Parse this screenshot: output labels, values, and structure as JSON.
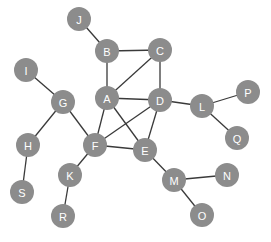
{
  "diagram": {
    "type": "undirected-graph",
    "node_radius": 12,
    "colors": {
      "node_fill": "#8c8c8c",
      "node_label": "#ffffff",
      "edge": "#3a3a3a",
      "background": "#ffffff"
    },
    "nodes": [
      {
        "id": "A",
        "label": "A",
        "x": 107,
        "y": 98
      },
      {
        "id": "B",
        "label": "B",
        "x": 107,
        "y": 51
      },
      {
        "id": "C",
        "label": "C",
        "x": 160,
        "y": 50
      },
      {
        "id": "D",
        "label": "D",
        "x": 160,
        "y": 100
      },
      {
        "id": "E",
        "label": "E",
        "x": 145,
        "y": 150
      },
      {
        "id": "F",
        "label": "F",
        "x": 95,
        "y": 145
      },
      {
        "id": "G",
        "label": "G",
        "x": 63,
        "y": 102
      },
      {
        "id": "H",
        "label": "H",
        "x": 28,
        "y": 145
      },
      {
        "id": "I",
        "label": "I",
        "x": 26,
        "y": 70
      },
      {
        "id": "J",
        "label": "J",
        "x": 79,
        "y": 19
      },
      {
        "id": "K",
        "label": "K",
        "x": 70,
        "y": 175
      },
      {
        "id": "L",
        "label": "L",
        "x": 202,
        "y": 106
      },
      {
        "id": "M",
        "label": "M",
        "x": 174,
        "y": 180
      },
      {
        "id": "N",
        "label": "N",
        "x": 227,
        "y": 175
      },
      {
        "id": "O",
        "label": "O",
        "x": 202,
        "y": 215
      },
      {
        "id": "P",
        "label": "P",
        "x": 248,
        "y": 92
      },
      {
        "id": "Q",
        "label": "Q",
        "x": 237,
        "y": 138
      },
      {
        "id": "R",
        "label": "R",
        "x": 63,
        "y": 216
      },
      {
        "id": "S",
        "label": "S",
        "x": 22,
        "y": 192
      }
    ],
    "edges": [
      [
        "J",
        "B"
      ],
      [
        "B",
        "C"
      ],
      [
        "B",
        "A"
      ],
      [
        "A",
        "C"
      ],
      [
        "C",
        "D"
      ],
      [
        "A",
        "D"
      ],
      [
        "A",
        "F"
      ],
      [
        "A",
        "E"
      ],
      [
        "D",
        "F"
      ],
      [
        "D",
        "E"
      ],
      [
        "F",
        "E"
      ],
      [
        "D",
        "L"
      ],
      [
        "L",
        "P"
      ],
      [
        "L",
        "Q"
      ],
      [
        "I",
        "G"
      ],
      [
        "G",
        "F"
      ],
      [
        "G",
        "H"
      ],
      [
        "H",
        "S"
      ],
      [
        "F",
        "K"
      ],
      [
        "K",
        "R"
      ],
      [
        "E",
        "M"
      ],
      [
        "M",
        "N"
      ],
      [
        "M",
        "O"
      ]
    ]
  }
}
